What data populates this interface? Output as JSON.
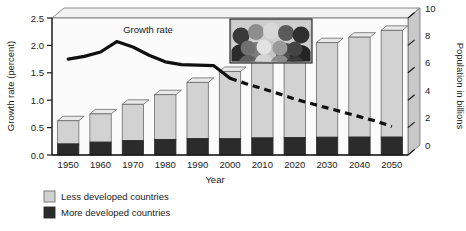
{
  "chart_data": {
    "type": "bar",
    "title": "",
    "xlabel": "Year",
    "ylabel": "Growth rate (percent)",
    "y2label": "Population in billions",
    "ylim": [
      0,
      2.5
    ],
    "y2lim": [
      0,
      10
    ],
    "grid": false,
    "legend_position": "bottom-left",
    "categories": [
      "1950",
      "1960",
      "1970",
      "1980",
      "1990",
      "2000",
      "2010",
      "2020",
      "2030",
      "2040",
      "2050"
    ],
    "xticklabels": [
      "1950",
      "1960",
      "1970",
      "1980",
      "1990",
      "2000",
      "2010",
      "2020",
      "2030",
      "2040",
      "2050"
    ],
    "yticklabels": [
      "0.0",
      "0.5",
      "1.0",
      "1.5",
      "2.0",
      "2.5"
    ],
    "ytickvalues": [
      0,
      0.5,
      1.0,
      1.5,
      2.0,
      2.5
    ],
    "y2ticklabels": [
      "0",
      "2",
      "4",
      "6",
      "8",
      "10"
    ],
    "y2tickvalues": [
      0,
      2,
      4,
      6,
      8,
      10
    ],
    "series": [
      {
        "name": "More developed countries",
        "axis": "y2",
        "type": "bar",
        "color": "#2b2b2b",
        "values": [
          0.81,
          0.94,
          1.05,
          1.14,
          1.21,
          1.19,
          1.25,
          1.28,
          1.3,
          1.31,
          1.31
        ]
      },
      {
        "name": "Less developed countries",
        "axis": "y2",
        "type": "bar",
        "color": "#d2d2d2",
        "values": [
          1.69,
          2.06,
          2.65,
          3.26,
          4.09,
          4.91,
          5.65,
          6.32,
          6.9,
          7.29,
          7.79
        ]
      },
      {
        "name": "Growth rate",
        "axis": "y",
        "type": "line",
        "color": "#101010",
        "style_solid_range": [
          "1950",
          "2000"
        ],
        "style_dashed_range": [
          "2000",
          "2050"
        ],
        "x": [
          1950,
          1955,
          1960,
          1965,
          1970,
          1975,
          1980,
          1985,
          1990,
          1995,
          2000,
          2005,
          2010,
          2015,
          2020,
          2025,
          2030,
          2035,
          2040,
          2045,
          2050
        ],
        "values": [
          1.75,
          1.8,
          1.88,
          2.07,
          1.97,
          1.82,
          1.7,
          1.65,
          1.64,
          1.63,
          1.4,
          1.3,
          1.21,
          1.12,
          1.02,
          0.94,
          0.86,
          0.78,
          0.7,
          0.62,
          0.52
        ]
      }
    ],
    "annotations": [
      {
        "text": "Growth rate",
        "x": 1967,
        "y": 2.22
      }
    ],
    "inset_image": "crowd-of-people-photo"
  },
  "legend": {
    "items": [
      {
        "label": "Less developed countries",
        "color": "#d2d2d2"
      },
      {
        "label": "More developed countries",
        "color": "#2b2b2b"
      }
    ]
  }
}
